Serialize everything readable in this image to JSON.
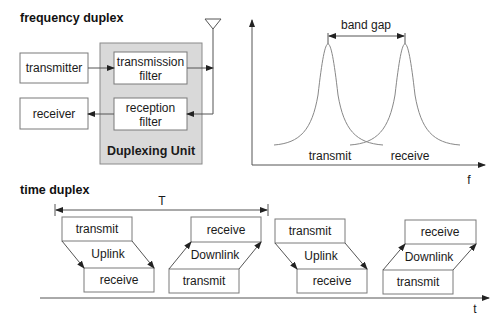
{
  "frequency_duplex": {
    "title": "frequency duplex",
    "blocks": {
      "transmitter": "transmitter",
      "receiver": "receiver",
      "transmission_filter_line1": "transmission",
      "transmission_filter_line2": "filter",
      "reception_filter_line1": "reception",
      "reception_filter_line2": "filter",
      "duplexing_unit": "Duplexing Unit"
    },
    "spectrum": {
      "band_gap_label": "band gap",
      "transmit_label": "transmit",
      "receive_label": "receive",
      "axis_label": "f"
    }
  },
  "time_duplex": {
    "title": "time duplex",
    "period_label": "T",
    "axis_label": "t",
    "slots": [
      {
        "top": "transmit",
        "middle": "Uplink",
        "bottom": "receive"
      },
      {
        "top": "receive",
        "middle": "Downlink",
        "bottom": "transmit"
      },
      {
        "top": "transmit",
        "middle": "Uplink",
        "bottom": "receive"
      },
      {
        "top": "receive",
        "middle": "Downlink",
        "bottom": "transmit"
      }
    ]
  },
  "colors": {
    "duplexing_unit_fill": "#d9d9d9",
    "line": "#555555",
    "box_border": "#7a7a7a"
  }
}
